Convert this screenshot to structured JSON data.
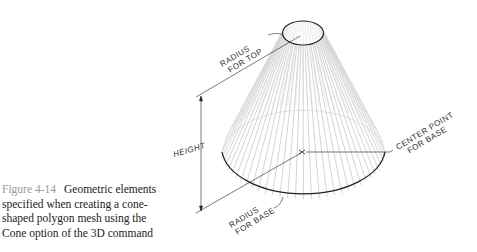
{
  "caption": {
    "figure_number": "Figure 4-14",
    "text": "Geometric elements specified when creating a cone-shaped polygon mesh using the Cone option of the 3D command"
  },
  "diagram": {
    "labels": {
      "radius_top_line1": "RADIUS",
      "radius_top_line2": "FOR TOP",
      "height": "HEIGHT",
      "center_line1": "CENTER POINT",
      "center_line2": "FOR BASE",
      "radius_base_line1": "RADIUS",
      "radius_base_line2": "FOR BASE"
    },
    "colors": {
      "outline": "#222222",
      "mesh_lines": "#9a9a9a",
      "caption_figure_number": "#9a9a9a"
    }
  }
}
